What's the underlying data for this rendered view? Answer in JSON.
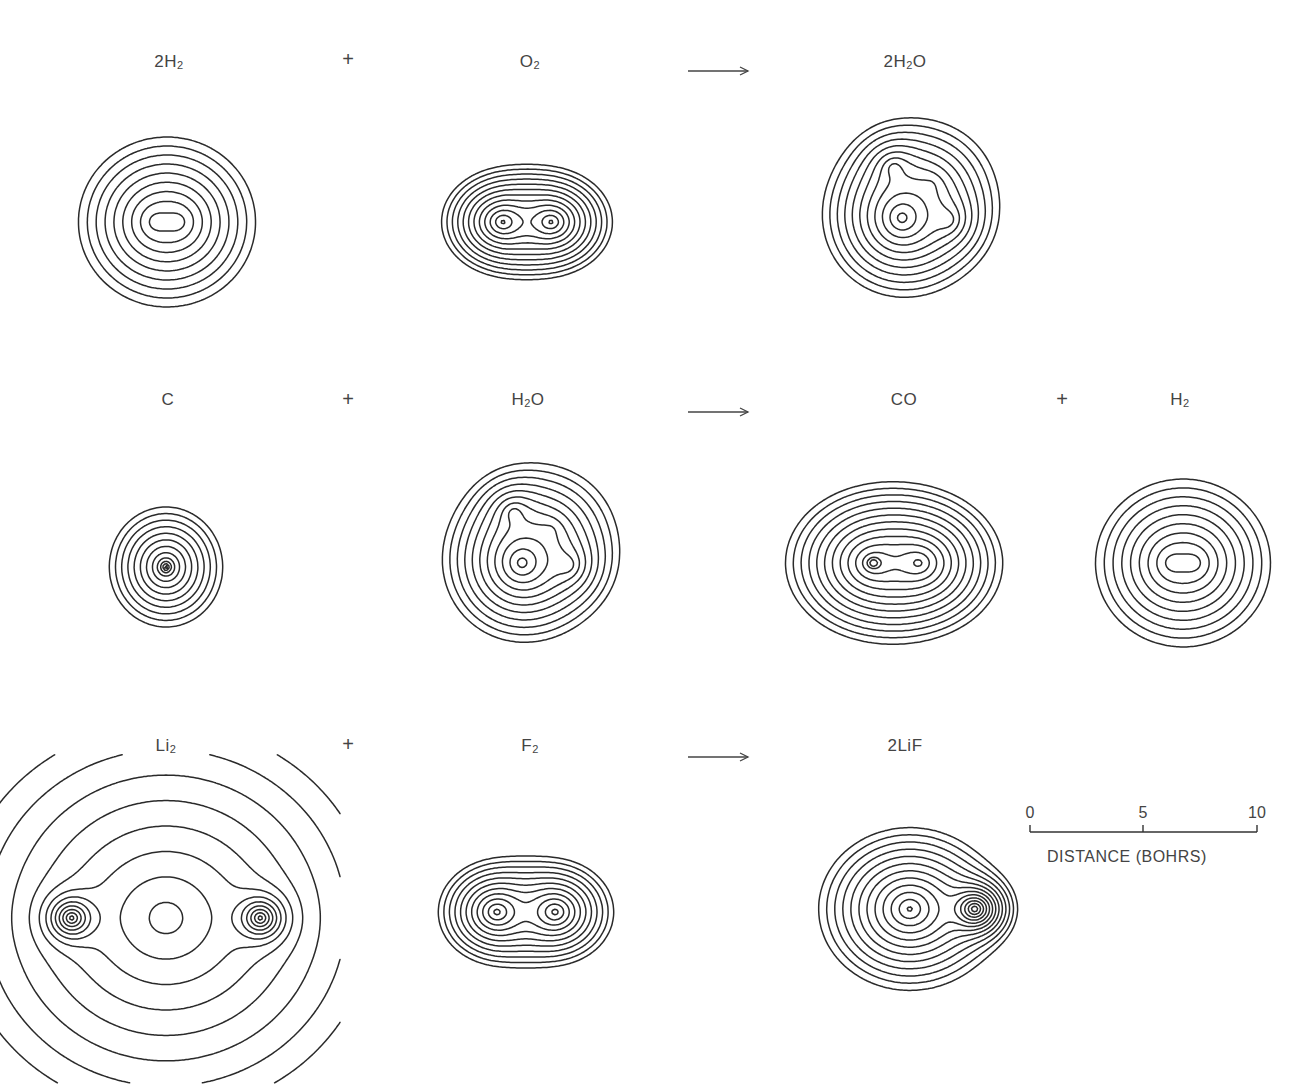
{
  "figure": {
    "background": "#ffffff",
    "line_color": "#2a2a2a",
    "text_color": "#444444"
  },
  "reactions": [
    {
      "id": "water-formation",
      "items": [
        {
          "kind": "species",
          "label": "2H",
          "sub": "2",
          "suffix": "",
          "x": 169,
          "y": 64,
          "map": "h2_row1"
        },
        {
          "kind": "operator",
          "symbol": "+",
          "x": 348,
          "y": 62
        },
        {
          "kind": "species",
          "label": "O",
          "sub": "2",
          "suffix": "",
          "x": 530,
          "y": 64,
          "map": "o2"
        },
        {
          "kind": "arrow",
          "x1": 688,
          "x2": 748,
          "y": 71
        },
        {
          "kind": "species",
          "label": "2H",
          "sub": "2",
          "suffix": "O",
          "x": 905,
          "y": 64,
          "map": "h2o_row1"
        }
      ]
    },
    {
      "id": "water-gas",
      "items": [
        {
          "kind": "species",
          "label": "C",
          "sub": "",
          "suffix": "",
          "x": 168,
          "y": 402,
          "map": "c"
        },
        {
          "kind": "operator",
          "symbol": "+",
          "x": 348,
          "y": 402
        },
        {
          "kind": "species",
          "label": "H",
          "sub": "2",
          "suffix": "O",
          "x": 528,
          "y": 402,
          "map": "h2o_row2"
        },
        {
          "kind": "arrow",
          "x1": 688,
          "x2": 748,
          "y": 412
        },
        {
          "kind": "species",
          "label": "CO",
          "sub": "",
          "suffix": "",
          "x": 904,
          "y": 402,
          "map": "co"
        },
        {
          "kind": "operator",
          "symbol": "+",
          "x": 1062,
          "y": 402
        },
        {
          "kind": "species",
          "label": "H",
          "sub": "2",
          "suffix": "",
          "x": 1180,
          "y": 402,
          "map": "h2_row2"
        }
      ]
    },
    {
      "id": "lithium-fluoride",
      "items": [
        {
          "kind": "species",
          "label": "Li",
          "sub": "2",
          "suffix": "",
          "x": 166,
          "y": 748,
          "map": "li2"
        },
        {
          "kind": "operator",
          "symbol": "+",
          "x": 348,
          "y": 747
        },
        {
          "kind": "species",
          "label": "F",
          "sub": "2",
          "suffix": "",
          "x": 530,
          "y": 748,
          "map": "f2"
        },
        {
          "kind": "arrow",
          "x1": 688,
          "x2": 748,
          "y": 757
        },
        {
          "kind": "species",
          "label": "2LiF",
          "sub": "",
          "suffix": "",
          "x": 905,
          "y": 748,
          "map": "lif"
        }
      ]
    }
  ],
  "maps": {
    "h2_row1": {
      "cx": 167,
      "cy": 222,
      "rx": 83,
      "ry": 83,
      "type": "diatomic_h",
      "levels": 10
    },
    "o2": {
      "cx": 527,
      "cy": 222,
      "rx": 86,
      "ry": 86,
      "type": "o2",
      "levels": 13
    },
    "h2o_row1": {
      "cx": 906,
      "cy": 210,
      "rx": 100,
      "ry": 100,
      "type": "h2o",
      "levels": 12
    },
    "c": {
      "cx": 166,
      "cy": 567,
      "rx": 86,
      "ry": 91,
      "type": "atom_c",
      "levels": 12
    },
    "h2o_row2": {
      "cx": 526,
      "cy": 555,
      "rx": 100,
      "ry": 100,
      "type": "h2o",
      "levels": 12
    },
    "co": {
      "cx": 890,
      "cy": 563,
      "rx": 110,
      "ry": 92,
      "type": "co",
      "levels": 13
    },
    "h2_row2": {
      "cx": 1183,
      "cy": 563,
      "rx": 82,
      "ry": 82,
      "type": "diatomic_h",
      "levels": 10
    },
    "li2": {
      "cx": 166,
      "cy": 918,
      "rx": 145,
      "ry": 136,
      "type": "li2",
      "levels": 12
    },
    "f2": {
      "cx": 526,
      "cy": 912,
      "rx": 91,
      "ry": 84,
      "type": "f2",
      "levels": 12
    },
    "lif": {
      "cx": 918,
      "cy": 909,
      "rx": 103,
      "ry": 92,
      "type": "lif",
      "levels": 14
    }
  },
  "scale_bar": {
    "x0": 1030,
    "x1": 1257,
    "y": 832,
    "ticks": [
      {
        "value": "0",
        "x": 1030
      },
      {
        "value": "5",
        "x": 1143
      },
      {
        "value": "10",
        "x": 1257
      }
    ],
    "title": "DISTANCE (BOHRS)",
    "title_x": 1047,
    "title_y": 848,
    "unit": "bohr"
  }
}
